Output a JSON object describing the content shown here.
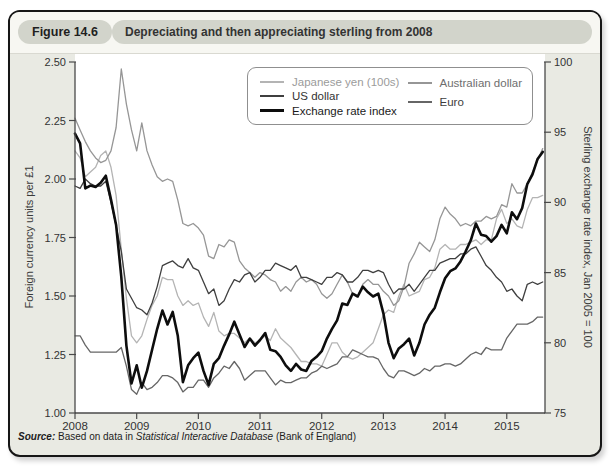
{
  "figure": {
    "label": "Figure 14.6",
    "title": "Depreciating and then appreciating sterling from 2008"
  },
  "source": {
    "prefix": "Source:",
    "body": " Based on data in ",
    "italic": "Statistical Interactive Database",
    "suffix": " (Bank of England)"
  },
  "chart": {
    "y_left": {
      "title": "Foreign currency units per £1",
      "range": [
        1.0,
        2.5
      ],
      "ticks": [
        "1.00",
        "1.25",
        "1.50",
        "1.75",
        "2.00",
        "2.25",
        "2.50"
      ]
    },
    "y_right": {
      "title": "Sterling exchange rate index, Jan 2005 = 100",
      "range": [
        75,
        100
      ],
      "ticks": [
        75,
        80,
        85,
        90,
        95,
        100
      ]
    },
    "x": {
      "range": [
        2008,
        2015.62
      ],
      "ticks": [
        2008,
        2009,
        2010,
        2011,
        2012,
        2013,
        2014,
        2015
      ]
    },
    "axis_color": "#4a4a4a",
    "grid": false,
    "legend_position": "top-center-inside-plot"
  },
  "chart_data": {
    "type": "line",
    "title": "Depreciating and then appreciating sterling from 2008",
    "x_note": "monthly values, Jan 2008 - Aug 2015 (decimal years from x_start, 12 samples per year)",
    "x_start": 2008,
    "samples_per_year": 12,
    "series": [
      {
        "id": "japanese-yen",
        "name": "Japanese yen (100s)",
        "axis": "left",
        "color": "#b4b4b4",
        "width": 1.3,
        "label_color": "#9b9b9b",
        "values": [
          2.12,
          2.09,
          2.01,
          2.03,
          2.05,
          2.1,
          2.12,
          2.05,
          1.93,
          1.7,
          1.49,
          1.33,
          1.3,
          1.33,
          1.4,
          1.46,
          1.5,
          1.58,
          1.57,
          1.57,
          1.5,
          1.46,
          1.48,
          1.46,
          1.47,
          1.41,
          1.37,
          1.43,
          1.35,
          1.33,
          1.34,
          1.34,
          1.32,
          1.3,
          1.32,
          1.3,
          1.31,
          1.33,
          1.31,
          1.36,
          1.32,
          1.3,
          1.28,
          1.25,
          1.22,
          1.22,
          1.21,
          1.21,
          1.2,
          1.25,
          1.3,
          1.3,
          1.26,
          1.24,
          1.23,
          1.24,
          1.26,
          1.28,
          1.3,
          1.36,
          1.42,
          1.44,
          1.43,
          1.5,
          1.55,
          1.5,
          1.51,
          1.52,
          1.57,
          1.58,
          1.62,
          1.7,
          1.72,
          1.7,
          1.7,
          1.72,
          1.72,
          1.73,
          1.74,
          1.72,
          1.74,
          1.74,
          1.83,
          1.87,
          1.81,
          1.83,
          1.8,
          1.79,
          1.87,
          1.92,
          1.92,
          1.93
        ]
      },
      {
        "id": "australian-dollar",
        "name": "Australian dollar",
        "axis": "left",
        "color": "#969696",
        "width": 1.3,
        "label_color": "#6e6e6e",
        "values": [
          2.26,
          2.21,
          2.16,
          2.12,
          2.09,
          2.07,
          2.08,
          2.12,
          2.22,
          2.47,
          2.32,
          2.21,
          2.12,
          2.24,
          2.12,
          2.06,
          2.01,
          1.99,
          2.0,
          1.99,
          1.91,
          1.81,
          1.8,
          1.81,
          1.79,
          1.76,
          1.67,
          1.66,
          1.72,
          1.71,
          1.74,
          1.73,
          1.65,
          1.62,
          1.6,
          1.58,
          1.6,
          1.59,
          1.57,
          1.56,
          1.52,
          1.54,
          1.52,
          1.56,
          1.58,
          1.56,
          1.57,
          1.55,
          1.51,
          1.49,
          1.51,
          1.55,
          1.59,
          1.56,
          1.51,
          1.5,
          1.55,
          1.57,
          1.55,
          1.55,
          1.52,
          1.5,
          1.46,
          1.48,
          1.54,
          1.64,
          1.68,
          1.73,
          1.71,
          1.69,
          1.74,
          1.83,
          1.88,
          1.85,
          1.83,
          1.8,
          1.81,
          1.8,
          1.82,
          1.82,
          1.84,
          1.83,
          1.84,
          1.89,
          1.88,
          1.98,
          1.94,
          1.94,
          1.98,
          2.03,
          2.08,
          2.13
        ]
      },
      {
        "id": "euro",
        "name": "Euro",
        "axis": "left",
        "color": "#666666",
        "width": 1.3,
        "label_color": "#3d3d3d",
        "values": [
          1.33,
          1.33,
          1.29,
          1.26,
          1.26,
          1.26,
          1.26,
          1.26,
          1.26,
          1.28,
          1.2,
          1.1,
          1.08,
          1.13,
          1.1,
          1.11,
          1.13,
          1.16,
          1.16,
          1.15,
          1.13,
          1.09,
          1.11,
          1.11,
          1.14,
          1.14,
          1.11,
          1.15,
          1.17,
          1.2,
          1.19,
          1.22,
          1.19,
          1.14,
          1.16,
          1.18,
          1.18,
          1.18,
          1.15,
          1.12,
          1.14,
          1.13,
          1.13,
          1.14,
          1.15,
          1.15,
          1.17,
          1.18,
          1.2,
          1.19,
          1.2,
          1.21,
          1.24,
          1.24,
          1.27,
          1.26,
          1.25,
          1.24,
          1.24,
          1.23,
          1.19,
          1.16,
          1.15,
          1.18,
          1.18,
          1.17,
          1.16,
          1.17,
          1.19,
          1.18,
          1.2,
          1.2,
          1.21,
          1.21,
          1.2,
          1.21,
          1.23,
          1.25,
          1.26,
          1.25,
          1.28,
          1.27,
          1.27,
          1.27,
          1.32,
          1.35,
          1.38,
          1.38,
          1.38,
          1.39,
          1.41,
          1.41
        ]
      },
      {
        "id": "us-dollar",
        "name": "US dollar",
        "axis": "left",
        "color": "#3f3f3f",
        "width": 1.3,
        "label_color": "#333333",
        "values": [
          1.97,
          1.96,
          2.0,
          1.98,
          1.97,
          1.97,
          1.99,
          1.9,
          1.8,
          1.69,
          1.53,
          1.49,
          1.45,
          1.44,
          1.42,
          1.47,
          1.54,
          1.63,
          1.64,
          1.65,
          1.63,
          1.62,
          1.66,
          1.62,
          1.61,
          1.56,
          1.51,
          1.53,
          1.46,
          1.48,
          1.53,
          1.57,
          1.56,
          1.59,
          1.6,
          1.56,
          1.58,
          1.61,
          1.61,
          1.64,
          1.63,
          1.62,
          1.61,
          1.63,
          1.58,
          1.58,
          1.57,
          1.56,
          1.55,
          1.58,
          1.58,
          1.6,
          1.59,
          1.56,
          1.56,
          1.58,
          1.61,
          1.61,
          1.6,
          1.61,
          1.6,
          1.55,
          1.51,
          1.53,
          1.53,
          1.55,
          1.52,
          1.55,
          1.58,
          1.61,
          1.61,
          1.64,
          1.65,
          1.66,
          1.66,
          1.68,
          1.68,
          1.7,
          1.71,
          1.67,
          1.63,
          1.61,
          1.58,
          1.56,
          1.52,
          1.53,
          1.5,
          1.48,
          1.55,
          1.56,
          1.55,
          1.56
        ]
      },
      {
        "id": "exchange-rate-index",
        "name": "Exchange rate index",
        "axis": "right",
        "color": "#0d0d0d",
        "width": 2.6,
        "label_color": "#1a1a1a",
        "values": [
          94.9,
          94.2,
          91.0,
          91.2,
          91.1,
          91.4,
          91.9,
          90.2,
          88.4,
          84.7,
          79.8,
          77.1,
          78.4,
          76.8,
          78.0,
          79.5,
          81.0,
          82.3,
          81.3,
          82.2,
          80.5,
          77.2,
          78.4,
          78.9,
          79.3,
          78.0,
          77.0,
          78.5,
          78.9,
          79.8,
          80.6,
          81.5,
          80.6,
          79.7,
          80.3,
          79.8,
          80.2,
          80.7,
          79.5,
          79.4,
          79.0,
          78.4,
          78.0,
          78.5,
          78.1,
          78.0,
          78.7,
          79.0,
          79.4,
          80.3,
          81.0,
          81.6,
          82.8,
          82.7,
          83.5,
          83.3,
          84.0,
          83.6,
          83.3,
          83.5,
          82.1,
          80.0,
          78.9,
          79.6,
          79.9,
          80.3,
          79.1,
          80.0,
          81.3,
          82.0,
          82.5,
          83.6,
          84.6,
          85.1,
          85.3,
          85.8,
          86.5,
          87.3,
          88.5,
          87.7,
          87.6,
          87.2,
          87.6,
          88.4,
          87.8,
          89.3,
          88.8,
          89.6,
          91.3,
          92.0,
          93.1,
          93.6
        ]
      }
    ]
  }
}
